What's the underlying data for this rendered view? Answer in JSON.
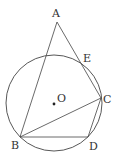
{
  "diagram": {
    "type": "geometry",
    "circle": {
      "center_label": "O",
      "cx": 54,
      "cy": 103,
      "r": 48
    },
    "points": {
      "A": {
        "label": "A",
        "x": 57,
        "y": 22
      },
      "B": {
        "label": "B",
        "x": 20,
        "y": 137
      },
      "C": {
        "label": "C",
        "x": 101,
        "y": 98
      },
      "D": {
        "label": "D",
        "x": 88,
        "y": 137
      },
      "E": {
        "label": "E",
        "x": 81,
        "y": 63
      },
      "O": {
        "label": "O",
        "x": 54,
        "y": 103
      }
    },
    "segments": [
      "AB",
      "AC",
      "BC",
      "BD",
      "CD"
    ],
    "stroke_color": "#444444"
  }
}
